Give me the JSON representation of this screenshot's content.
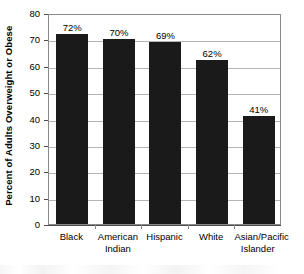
{
  "chart_data": {
    "type": "bar",
    "title": "",
    "subtitle": "",
    "xlabel": "",
    "ylabel": "Percent of Adults Overweight or Obese",
    "categories": [
      "Black",
      "American Indian",
      "Hispanic",
      "White",
      "Asian/Pacific Islander"
    ],
    "category_lines": [
      [
        "Black"
      ],
      [
        "American",
        "Indian"
      ],
      [
        "Hispanic"
      ],
      [
        "White"
      ],
      [
        "Asian/Pacific",
        "Islander"
      ]
    ],
    "values": [
      72,
      70,
      69,
      62,
      41
    ],
    "data_labels": [
      "72%",
      "70%",
      "69%",
      "62%",
      "41%"
    ],
    "ylim": [
      0,
      80
    ],
    "ytick_values": [
      0,
      10,
      20,
      30,
      40,
      50,
      60,
      70,
      80
    ],
    "ytick_labels": [
      "0",
      "10",
      "20",
      "30",
      "40",
      "50",
      "60",
      "70",
      "80"
    ],
    "grid": "horizontal",
    "legend": "none",
    "bar_color": "#1a1a1a",
    "grid_color": "#b4b4b4",
    "axis_color": "#8a8a8a",
    "background_color": "#ffffff"
  }
}
